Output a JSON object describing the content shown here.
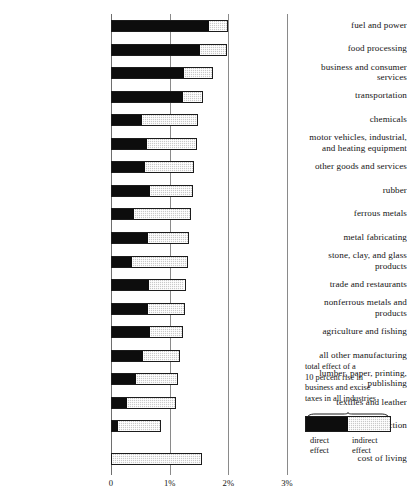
{
  "chart_data": {
    "type": "bar",
    "orientation": "horizontal",
    "stacked": true,
    "title": "",
    "xlabel": "",
    "ylabel": "",
    "xlim": [
      0,
      3
    ],
    "grid": true,
    "xticks": [
      0,
      1,
      2,
      3
    ],
    "xticklabels": [
      "0",
      "1%",
      "2%",
      "3%"
    ],
    "legend_position": "right",
    "series": [
      {
        "name": "direct effect",
        "color": "#0d0d0d",
        "values": [
          1.69,
          1.52,
          1.26,
          1.23,
          0.53,
          0.61,
          0.58,
          0.66,
          0.39,
          0.63,
          0.35,
          0.64,
          0.63,
          0.67,
          0.54,
          0.43,
          0.26,
          0.1,
          0.0
        ]
      },
      {
        "name": "indirect effect",
        "color": "#c9c9c9",
        "values": [
          0.3,
          0.46,
          0.48,
          0.33,
          0.96,
          0.85,
          0.84,
          0.73,
          0.97,
          0.7,
          0.96,
          0.63,
          0.63,
          0.56,
          0.63,
          0.71,
          0.85,
          0.76,
          1.55
        ]
      }
    ],
    "categories": [
      "fuel and power",
      "food processing",
      "business and consumer services",
      "transportation",
      "chemicals",
      "motor vehicles, industrial, and heating equipment",
      "other goods and services",
      "rubber",
      "ferrous metals",
      "metal fabricating",
      "stone, clay, and glass products",
      "trade and restaurants",
      "nonferrous metals and products",
      "agriculture and fishing",
      "all other manufacturing",
      "lumber, paper, printing, publishing",
      "textiles and leather",
      "construction",
      "cost of living"
    ],
    "category_lines": [
      [
        "fuel and power"
      ],
      [
        "food processing"
      ],
      [
        "business and consumer",
        "services"
      ],
      [
        "transportation"
      ],
      [
        "chemicals"
      ],
      [
        "motor vehicles, industrial,",
        "and heating equipment"
      ],
      [
        "other goods and services"
      ],
      [
        "rubber"
      ],
      [
        "ferrous metals"
      ],
      [
        "metal fabricating"
      ],
      [
        "stone, clay, and glass",
        "products"
      ],
      [
        "trade and restaurants"
      ],
      [
        "nonferrous metals and",
        "products"
      ],
      [
        "agriculture and fishing"
      ],
      [
        "all other manufacturing"
      ],
      [
        "lumber, paper, printing,",
        "publishing"
      ],
      [
        "textiles and leather"
      ],
      [
        "construction"
      ],
      [
        "cost of living"
      ]
    ],
    "totals": [
      1.99,
      1.98,
      1.74,
      1.56,
      1.49,
      1.46,
      1.42,
      1.39,
      1.36,
      1.33,
      1.31,
      1.27,
      1.26,
      1.23,
      1.17,
      1.14,
      1.11,
      0.86,
      1.55
    ]
  },
  "legend": {
    "caption_lines": [
      "total effect of a",
      "10 percent rise in",
      "business and excise",
      "taxes in all industries"
    ],
    "direct_label_lines": [
      "direct",
      "effect"
    ],
    "indirect_label_lines": [
      "indirect",
      "effect"
    ],
    "direct_color": "#0d0d0d",
    "indirect_color": "#c9c9c9"
  }
}
